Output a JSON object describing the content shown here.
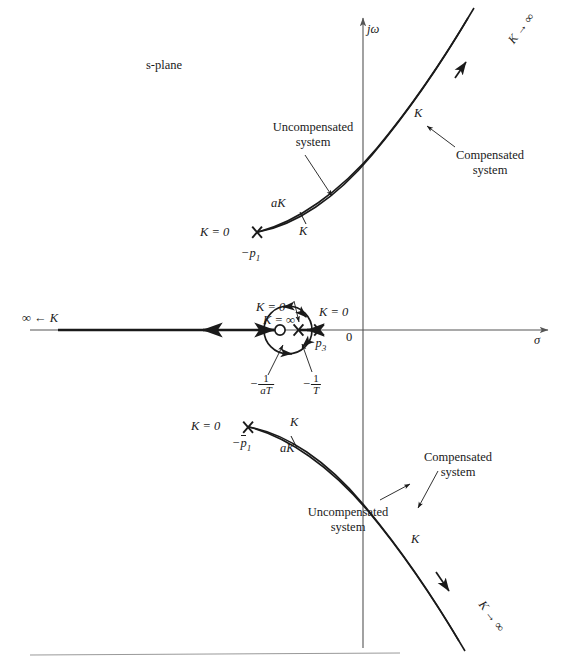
{
  "figure": {
    "plane_label": "s-plane",
    "axes": {
      "imag_label": "jω",
      "real_label": "σ",
      "origin_label": "0"
    },
    "annotations": {
      "uncompensated_upper": "Uncompensated\nsystem",
      "uncompensated_lower": "Uncompensated\nsystem",
      "compensated_upper": "Compensated\nsystem",
      "compensated_lower": "Compensated\nsystem"
    },
    "gain_labels": {
      "k_zero_upper_pole": "K = 0",
      "k_zero_lower_pole": "K = 0",
      "k_zero_p3": "K = 0",
      "k_zero_compensator_pole": "K = 0",
      "k_infinity_zero": "K = ∞",
      "k_to_infinity_upper": "K → ∞",
      "k_to_infinity_lower": "K → ∞",
      "k_arrow_real_axis": "∞ ← K",
      "aK_upper": "aK",
      "K_upper_inner": "K",
      "K_upper_branch": "K",
      "K_lower_branch": "K",
      "K_lower_inner": "K",
      "aK_lower": "aK"
    },
    "poles_zeros": {
      "p1": "−p",
      "p1_sub": "1",
      "p1_conj_base": "p",
      "p1_conj_sub": "1",
      "p3": "−p",
      "p3_sub": "3",
      "zero_compensator": {
        "minus": "−",
        "num": "1",
        "den": "aT"
      },
      "pole_compensator": {
        "minus": "−",
        "num": "1",
        "den": "T"
      }
    },
    "colors": {
      "ink": "#1a1a1a",
      "axis": "#555555",
      "rule": "#999999"
    }
  }
}
